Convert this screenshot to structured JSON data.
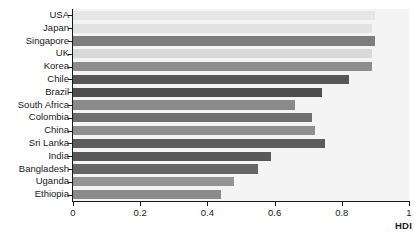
{
  "chart_data": {
    "type": "bar",
    "orientation": "horizontal",
    "title": "",
    "xlabel": "HDI",
    "ylabel": "",
    "xlim": [
      0,
      1
    ],
    "ylim": null,
    "grid": false,
    "legend": null,
    "xticks": [
      "0",
      "0.2",
      "0.4",
      "0.6",
      "0.8",
      "1"
    ],
    "xtick_values": [
      0,
      0.2,
      0.4,
      0.6,
      0.8,
      1
    ],
    "categories": [
      "USA",
      "Japan",
      "Singapore",
      "UK",
      "Korea",
      "Chile",
      "Brazil",
      "South Africa",
      "Colombia",
      "China",
      "Sri Lanka",
      "India",
      "Bangladesh",
      "Uganda",
      "Ethiopia"
    ],
    "values": [
      0.9,
      0.89,
      0.9,
      0.89,
      0.89,
      0.82,
      0.74,
      0.66,
      0.71,
      0.72,
      0.75,
      0.59,
      0.55,
      0.48,
      0.44
    ],
    "bar_colors": [
      "#e6e6e6",
      "#e2e2e2",
      "#7d7d7d",
      "#d9d9d9",
      "#8d8d8d",
      "#575757",
      "#4e4e4e",
      "#8a8a8a",
      "#6e6e6e",
      "#8f8f8f",
      "#5c5c5c",
      "#585858",
      "#666666",
      "#949494",
      "#8b8b8b"
    ],
    "plot_background": "#f4f4f4",
    "axis_color": "#1a1a1a"
  }
}
